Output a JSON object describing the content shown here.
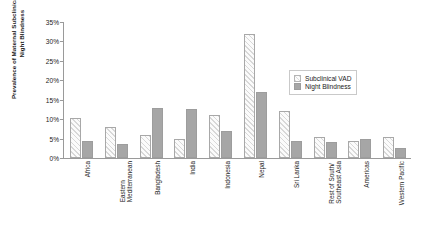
{
  "chart_data": {
    "type": "bar",
    "title": "",
    "xlabel": "",
    "ylabel": "Prevalence of Maternal Subclinical VAD and Night Blindness",
    "ylim": [
      0,
      35
    ],
    "ytick_labels": [
      "0%",
      "5%",
      "10%",
      "15%",
      "20%",
      "25%",
      "30%",
      "35%"
    ],
    "ytick_values": [
      0,
      5,
      10,
      15,
      20,
      25,
      30,
      35
    ],
    "grid": false,
    "legend_position": "inside-right",
    "categories": [
      "Africa",
      "Eastern\nMediterranean",
      "Bangladesh",
      "India",
      "Indonesia",
      "Nepal",
      "Sri Lanka",
      "Rest of South/\nSoutheast Asia",
      "Americas",
      "Western Pacific"
    ],
    "series": [
      {
        "name": "Subclinical VAD",
        "color": "#fbfbfb",
        "pattern": "diagonal-hatch",
        "values": [
          10.3,
          8.0,
          6.0,
          5.0,
          11.0,
          32.0,
          12.0,
          5.5,
          4.5,
          5.5
        ]
      },
      {
        "name": "Night Blindness",
        "color": "#a6a6a6",
        "pattern": "solid",
        "values": [
          4.5,
          3.5,
          13.0,
          12.5,
          7.0,
          17.0,
          4.5,
          4.0,
          5.0,
          2.5
        ]
      }
    ]
  },
  "legend": {
    "items": [
      {
        "label": "Subclinical VAD"
      },
      {
        "label": "Night Blindness"
      }
    ]
  }
}
